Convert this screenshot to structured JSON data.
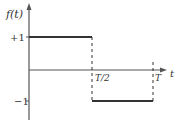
{
  "diagram": {
    "y_axis_label": "f(t)",
    "x_axis_label": "t",
    "y_ticks": [
      {
        "label": "+1",
        "value": 1
      },
      {
        "label": "−1",
        "value": -1
      }
    ],
    "x_ticks": [
      {
        "label": "T/2",
        "value": 0.5
      },
      {
        "label": "T",
        "value": 1
      }
    ],
    "segments": [
      {
        "from": 0,
        "to": 0.5,
        "level": 1
      },
      {
        "from": 0.5,
        "to": 1,
        "level": -1
      }
    ],
    "colors": {
      "line": "#333333",
      "axis": "#555555"
    }
  }
}
